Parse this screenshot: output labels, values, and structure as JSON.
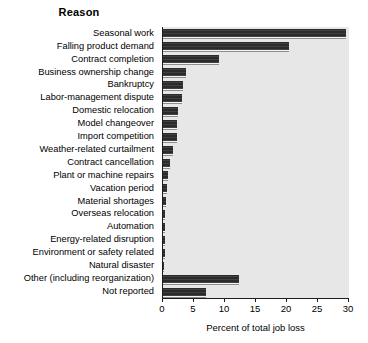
{
  "chart_data": {
    "type": "bar",
    "orientation": "horizontal",
    "title": "Reason",
    "xlabel": "Percent of total job loss",
    "ylabel": "Reason",
    "xlim": [
      0,
      30
    ],
    "xticks": [
      0,
      5,
      10,
      15,
      20,
      25,
      30
    ],
    "xtick_labels": [
      "0",
      "5",
      "10",
      "15",
      "20",
      "25",
      "30"
    ],
    "grid": false,
    "legend": "none",
    "categories": [
      "Seasonal work",
      "Falling product demand",
      "Contract completion",
      "Business ownership change",
      "Bankruptcy",
      "Labor-management dispute",
      "Domestic relocation",
      "Model changeover",
      "Import competition",
      "Weather-related curtailment",
      "Contract cancellation",
      "Plant or machine repairs",
      "Vacation period",
      "Material shortages",
      "Overseas relocation",
      "Automation",
      "Energy-related disruption",
      "Environment or safety related",
      "Natural disaster",
      "Other (including reorganization)",
      "Not reported"
    ],
    "values": [
      29.5,
      20.3,
      9.0,
      3.7,
      3.2,
      3.1,
      2.4,
      2.3,
      2.2,
      1.6,
      1.2,
      0.8,
      0.7,
      0.5,
      0.4,
      0.4,
      0.3,
      0.3,
      0.2,
      12.2,
      7.0
    ],
    "colors": {
      "bar": "#2b2b2b",
      "plot_background": "#e7e7e7",
      "axis": "#1c1c1c",
      "page_background": "#ffffff",
      "text": "#000000"
    }
  }
}
